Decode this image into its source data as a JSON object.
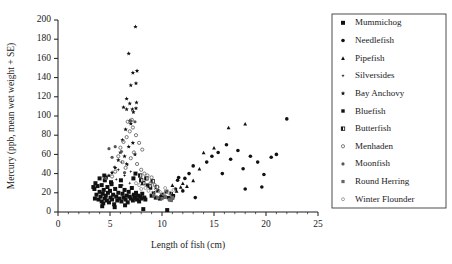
{
  "chart_data": {
    "type": "scatter",
    "title": "",
    "xlabel": "Length of fish (cm)",
    "ylabel": "Mercury (ppb, mean wet weight + SE)",
    "xlim": [
      0,
      25
    ],
    "ylim": [
      0,
      200
    ],
    "xticks": [
      0,
      5,
      10,
      15,
      20,
      25
    ],
    "yticks": [
      0,
      20,
      40,
      60,
      80,
      100,
      120,
      140,
      160,
      180,
      200
    ],
    "xtick_labels": [
      "0",
      "5",
      "10",
      "15",
      "20",
      "25"
    ],
    "ytick_labels": [
      "0",
      "20",
      "40",
      "60",
      "80",
      "100",
      "120",
      "140",
      "160",
      "180",
      "200"
    ],
    "grid": false,
    "legend_position": "right-outside",
    "series": [
      {
        "name": "Mummichog",
        "marker": "square",
        "fill": "#111111",
        "size": 4.0,
        "points": [
          [
            3.5,
            24
          ],
          [
            3.6,
            30
          ],
          [
            3.7,
            18
          ],
          [
            3.8,
            27
          ],
          [
            3.9,
            13
          ],
          [
            4.0,
            21
          ],
          [
            4.0,
            35
          ],
          [
            4.1,
            16
          ],
          [
            4.2,
            11
          ],
          [
            4.2,
            28
          ],
          [
            4.3,
            19
          ],
          [
            4.35,
            9
          ],
          [
            4.4,
            23
          ],
          [
            4.5,
            14
          ],
          [
            4.5,
            33
          ],
          [
            4.6,
            17
          ],
          [
            4.7,
            12
          ],
          [
            4.75,
            26
          ],
          [
            4.8,
            20
          ],
          [
            4.9,
            10
          ],
          [
            5.0,
            22
          ],
          [
            5.05,
            15
          ],
          [
            5.1,
            31
          ],
          [
            5.2,
            13
          ],
          [
            5.3,
            18
          ],
          [
            5.4,
            8
          ],
          [
            5.5,
            24
          ],
          [
            5.6,
            16
          ],
          [
            5.7,
            12
          ],
          [
            5.8,
            20
          ],
          [
            5.9,
            14
          ],
          [
            6.0,
            27
          ],
          [
            6.1,
            11
          ],
          [
            6.2,
            19
          ],
          [
            6.3,
            15
          ],
          [
            6.4,
            23
          ],
          [
            6.5,
            13
          ],
          [
            6.6,
            17
          ],
          [
            6.7,
            10
          ],
          [
            6.8,
            21
          ],
          [
            6.9,
            16
          ],
          [
            7.0,
            14
          ],
          [
            7.1,
            25
          ],
          [
            7.2,
            12
          ],
          [
            7.3,
            18
          ],
          [
            7.4,
            15
          ],
          [
            7.5,
            20
          ],
          [
            7.6,
            13
          ],
          [
            7.7,
            17
          ],
          [
            7.8,
            11
          ],
          [
            7.9,
            16
          ],
          [
            8.0,
            14
          ],
          [
            8.1,
            19
          ],
          [
            8.2,
            3
          ],
          [
            8.3,
            15
          ],
          [
            8.4,
            13
          ],
          [
            3.4,
            26
          ],
          [
            3.55,
            14
          ],
          [
            4.45,
            38
          ],
          [
            4.6,
            36
          ],
          [
            5.15,
            29
          ],
          [
            6.05,
            33
          ],
          [
            7.25,
            35
          ],
          [
            7.45,
            40
          ],
          [
            4.25,
            6
          ],
          [
            5.45,
            5
          ],
          [
            6.45,
            7
          ],
          [
            9.0,
            17
          ],
          [
            9.4,
            15
          ],
          [
            9.8,
            14
          ],
          [
            10.2,
            16
          ],
          [
            10.5,
            2
          ],
          [
            10.8,
            13
          ],
          [
            11.0,
            15
          ]
        ]
      },
      {
        "name": "Needlefish",
        "marker": "circle",
        "fill": "#111111",
        "size": 3.6,
        "points": [
          [
            11.3,
            24
          ],
          [
            11.5,
            33
          ],
          [
            11.6,
            36
          ],
          [
            12.0,
            22
          ],
          [
            13.2,
            15
          ],
          [
            14.3,
            52
          ],
          [
            14.8,
            58
          ],
          [
            15.4,
            62
          ],
          [
            15.8,
            40
          ],
          [
            16.2,
            70
          ],
          [
            16.6,
            55
          ],
          [
            17.3,
            64
          ],
          [
            17.8,
            45
          ],
          [
            18.0,
            24
          ],
          [
            18.5,
            58
          ],
          [
            19.2,
            52
          ],
          [
            19.6,
            26
          ],
          [
            19.8,
            39
          ],
          [
            20.5,
            57
          ],
          [
            21.0,
            60
          ],
          [
            22.0,
            97
          ],
          [
            13.0,
            48
          ],
          [
            12.6,
            40
          ],
          [
            12.2,
            35
          ]
        ]
      },
      {
        "name": "Pipefish",
        "marker": "triangle",
        "fill": "#111111",
        "size": 3.8,
        "points": [
          [
            11.0,
            28
          ],
          [
            11.4,
            22
          ],
          [
            12.0,
            30
          ],
          [
            12.4,
            27
          ],
          [
            13.6,
            45
          ],
          [
            14.0,
            62
          ],
          [
            15.0,
            67
          ],
          [
            16.4,
            88
          ],
          [
            18.0,
            92
          ],
          [
            10.8,
            20
          ],
          [
            11.8,
            26
          ],
          [
            13.0,
            33
          ]
        ]
      },
      {
        "name": "Silversides",
        "marker": "star4",
        "fill": "#111111",
        "size": 3.4,
        "points": [
          [
            5.4,
            47
          ],
          [
            5.8,
            44
          ],
          [
            6.1,
            52
          ],
          [
            6.4,
            38
          ],
          [
            6.7,
            49
          ],
          [
            7.0,
            42
          ],
          [
            5.6,
            34
          ],
          [
            6.9,
            30
          ],
          [
            7.3,
            36
          ],
          [
            6.2,
            28
          ],
          [
            5.2,
            31
          ]
        ]
      },
      {
        "name": "Bay Anchovy",
        "marker": "star5",
        "fill": "#111111",
        "size": 4.6,
        "points": [
          [
            7.45,
            193
          ],
          [
            6.8,
            165
          ],
          [
            6.6,
            118
          ],
          [
            7.2,
            145
          ],
          [
            7.6,
            147
          ],
          [
            7.0,
            132
          ],
          [
            7.5,
            134
          ],
          [
            6.9,
            113
          ],
          [
            7.55,
            114
          ],
          [
            7.15,
            107
          ],
          [
            7.25,
            104
          ],
          [
            6.3,
            109
          ],
          [
            6.6,
            107
          ],
          [
            7.5,
            108
          ],
          [
            6.9,
            95
          ],
          [
            7.0,
            92
          ],
          [
            6.5,
            86
          ],
          [
            6.2,
            75
          ],
          [
            6.8,
            68
          ],
          [
            7.2,
            72
          ],
          [
            6.0,
            62
          ],
          [
            6.4,
            58
          ],
          [
            5.8,
            54
          ],
          [
            6.6,
            50
          ],
          [
            5.5,
            46
          ],
          [
            7.4,
            60
          ],
          [
            5.2,
            41
          ],
          [
            4.9,
            38
          ]
        ]
      },
      {
        "name": "Bluefish",
        "marker": "square",
        "fill": "#111111",
        "size": 3.4,
        "points": [
          [
            8.6,
            28
          ],
          [
            9.2,
            20
          ],
          [
            9.6,
            22
          ],
          [
            10.0,
            18
          ],
          [
            10.4,
            21
          ],
          [
            10.9,
            19
          ],
          [
            11.1,
            17
          ],
          [
            8.9,
            25
          ],
          [
            9.9,
            16
          ],
          [
            10.6,
            15
          ]
        ]
      },
      {
        "name": "Butterfish",
        "marker": "square-half",
        "fill": "#333333",
        "size": 3.4,
        "points": [
          [
            8.2,
            30
          ],
          [
            8.5,
            35
          ],
          [
            8.8,
            27
          ],
          [
            9.1,
            32
          ],
          [
            9.5,
            26
          ],
          [
            7.9,
            38
          ],
          [
            8.0,
            33
          ]
        ]
      },
      {
        "name": "Menhaden",
        "marker": "circle-open",
        "fill": "none",
        "size": 3.2,
        "points": [
          [
            6.0,
            67
          ],
          [
            6.3,
            73
          ],
          [
            6.6,
            78
          ],
          [
            6.9,
            84
          ],
          [
            7.2,
            88
          ],
          [
            7.5,
            80
          ],
          [
            7.8,
            72
          ],
          [
            8.1,
            65
          ],
          [
            5.8,
            58
          ],
          [
            6.2,
            52
          ],
          [
            6.5,
            46
          ],
          [
            7.0,
            56
          ],
          [
            7.3,
            62
          ],
          [
            7.6,
            50
          ],
          [
            8.0,
            44
          ],
          [
            8.3,
            40
          ],
          [
            5.5,
            42
          ],
          [
            8.6,
            38
          ],
          [
            9.0,
            36
          ],
          [
            6.7,
            94
          ],
          [
            7.1,
            96
          ],
          [
            5.2,
            37
          ],
          [
            8.9,
            30
          ],
          [
            9.3,
            28
          ]
        ]
      },
      {
        "name": "Moonfish",
        "marker": "circle",
        "fill": "#555555",
        "size": 3.2,
        "points": [
          [
            7.0,
            95
          ],
          [
            7.4,
            94
          ],
          [
            5.5,
            68
          ],
          [
            4.9,
            66
          ],
          [
            6.1,
            63
          ],
          [
            5.2,
            57
          ],
          [
            6.4,
            41
          ],
          [
            4.6,
            35
          ]
        ]
      },
      {
        "name": "Round Herring",
        "marker": "square",
        "fill": "#666666",
        "size": 3.2,
        "points": [
          [
            9.6,
            15
          ],
          [
            10.0,
            14
          ],
          [
            10.3,
            16
          ],
          [
            10.7,
            13
          ],
          [
            11.0,
            15
          ],
          [
            9.2,
            17
          ],
          [
            10.9,
            12
          ]
        ]
      },
      {
        "name": "Winter Flounder",
        "marker": "circle-open-gray",
        "fill": "none",
        "size": 3.0,
        "points": [
          [
            8.7,
            22
          ],
          [
            9.1,
            20
          ],
          [
            9.4,
            24
          ],
          [
            9.8,
            21
          ],
          [
            10.1,
            19
          ],
          [
            10.5,
            22
          ],
          [
            10.8,
            20
          ],
          [
            11.1,
            23
          ],
          [
            8.4,
            25
          ],
          [
            9.6,
            26
          ],
          [
            10.3,
            25
          ],
          [
            7.8,
            28
          ],
          [
            8.0,
            24
          ],
          [
            7.5,
            30
          ]
        ]
      }
    ]
  },
  "legend": {
    "items": [
      {
        "label": "Mummichog",
        "marker": "square"
      },
      {
        "label": "Needlefish",
        "marker": "circle"
      },
      {
        "label": "Pipefish",
        "marker": "triangle"
      },
      {
        "label": "Silversides",
        "marker": "star4"
      },
      {
        "label": "Bay Anchovy",
        "marker": "star5"
      },
      {
        "label": "Bluefish",
        "marker": "square"
      },
      {
        "label": "Butterfish",
        "marker": "square-half"
      },
      {
        "label": "Menhaden",
        "marker": "circle-open"
      },
      {
        "label": "Moonfish",
        "marker": "circle"
      },
      {
        "label": "Round Herring",
        "marker": "square"
      },
      {
        "label": "Winter Flounder",
        "marker": "circle-open-gray"
      }
    ]
  },
  "colors": {
    "axis": "#1a1a1a",
    "marker_dark": "#111111",
    "marker_gray": "#666666",
    "legend_border": "#3a3a3a",
    "background": "#ffffff"
  }
}
